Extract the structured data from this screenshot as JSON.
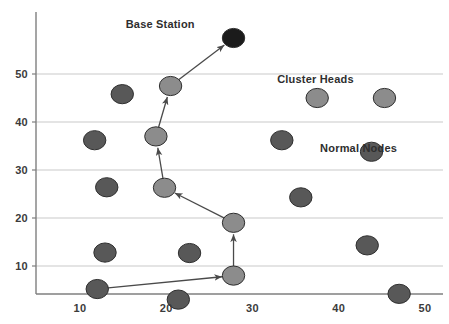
{
  "chart_data": {
    "type": "scatter",
    "title": "",
    "xlabel": "",
    "ylabel": "",
    "xlim": [
      5,
      50
    ],
    "ylim": [
      0,
      60
    ],
    "grid": true,
    "grid_axis": "y",
    "legend": "none",
    "xticks": [
      10,
      20,
      30,
      40,
      50
    ],
    "yticks": [
      10,
      20,
      30,
      40,
      50
    ],
    "xtick_labels": [
      "10",
      "20",
      "30",
      "40",
      "50"
    ],
    "ytick_labels": [
      "10",
      "20",
      "30",
      "40",
      "50"
    ],
    "series": [
      {
        "name": "Base Station",
        "color": "#1b1b1b",
        "marker": "circle",
        "points": [
          {
            "x": 27.8,
            "y": 57.5
          }
        ]
      },
      {
        "name": "Cluster Heads",
        "color": "#8c8c8c",
        "marker": "circle",
        "points": [
          {
            "x": 20.5,
            "y": 47.5
          },
          {
            "x": 18.8,
            "y": 37.0
          },
          {
            "x": 19.8,
            "y": 26.3
          },
          {
            "x": 27.8,
            "y": 19.0
          },
          {
            "x": 27.8,
            "y": 8.0
          },
          {
            "x": 37.5,
            "y": 45.0
          },
          {
            "x": 45.3,
            "y": 45.0
          }
        ]
      },
      {
        "name": "Normal Nodes",
        "color": "#585858",
        "marker": "circle",
        "points": [
          {
            "x": 14.9,
            "y": 45.8
          },
          {
            "x": 11.7,
            "y": 36.2
          },
          {
            "x": 13.1,
            "y": 26.4
          },
          {
            "x": 12.9,
            "y": 12.8
          },
          {
            "x": 12.0,
            "y": 5.2
          },
          {
            "x": 22.7,
            "y": 12.7
          },
          {
            "x": 21.4,
            "y": 3.0
          },
          {
            "x": 33.4,
            "y": 36.2
          },
          {
            "x": 43.8,
            "y": 33.8
          },
          {
            "x": 35.6,
            "y": 24.3
          },
          {
            "x": 43.3,
            "y": 14.3
          },
          {
            "x": 47.0,
            "y": 4.2
          }
        ]
      }
    ],
    "annotations": [
      {
        "text": "Base Station",
        "x": 19.3,
        "y": 60.5
      },
      {
        "text": "Cluster Heads",
        "x": 37.3,
        "y": 49.0
      },
      {
        "text": "Normal Nodes",
        "x": 42.3,
        "y": 34.5
      }
    ],
    "arrows": [
      {
        "from": {
          "x": 20.5,
          "y": 47.5
        },
        "to": {
          "x": 27.8,
          "y": 57.5
        },
        "label": "ch-to-base-station"
      },
      {
        "from": {
          "x": 18.8,
          "y": 37.0
        },
        "to": {
          "x": 20.5,
          "y": 47.5
        },
        "label": "ch-to-ch-upper"
      },
      {
        "from": {
          "x": 19.8,
          "y": 26.3
        },
        "to": {
          "x": 18.8,
          "y": 37.0
        },
        "label": "ch-to-ch-middle"
      },
      {
        "from": {
          "x": 27.8,
          "y": 19.0
        },
        "to": {
          "x": 19.8,
          "y": 26.3
        },
        "label": "ch-to-ch-lower"
      },
      {
        "from": {
          "x": 27.8,
          "y": 8.0
        },
        "to": {
          "x": 27.8,
          "y": 19.0
        },
        "label": "ch-to-ch-vertical"
      },
      {
        "from": {
          "x": 12.0,
          "y": 5.2
        },
        "to": {
          "x": 27.8,
          "y": 8.0
        },
        "label": "node-to-ch-bottom"
      }
    ]
  },
  "style": {
    "background": "#ffffff",
    "axis_color": "#7f7f7f",
    "grid_color": "#c9c9c9",
    "arrow_color": "#4a4a4a",
    "node_stroke": "#2f2f2f",
    "tick_text_color": "#3b3b3b",
    "annotation_text_color": "#2e2e2e"
  }
}
